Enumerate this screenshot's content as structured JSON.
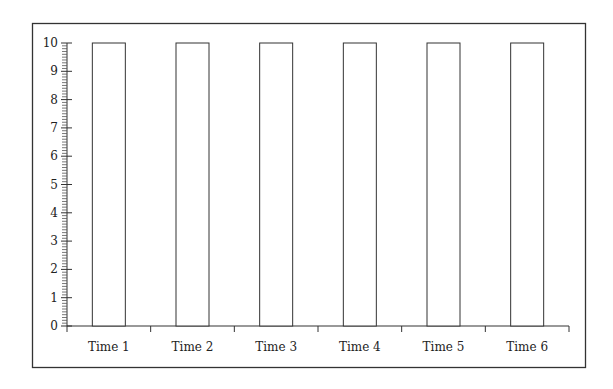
{
  "chart_data": {
    "type": "bar",
    "title": "",
    "xlabel": "",
    "ylabel": "",
    "categories": [
      "Time 1",
      "Time 2",
      "Time 3",
      "Time 4",
      "Time 5",
      "Time 6"
    ],
    "values": [
      10,
      10,
      10,
      10,
      10,
      10
    ],
    "ylim": [
      0,
      10
    ],
    "yticks": [
      0,
      1,
      2,
      3,
      4,
      5,
      6,
      7,
      8,
      9,
      10
    ],
    "y_minor_ticks_per_unit": 10,
    "grid": false,
    "legend": null,
    "bar_fill": "#ffffff",
    "bar_stroke": "#333333",
    "frame": true
  }
}
